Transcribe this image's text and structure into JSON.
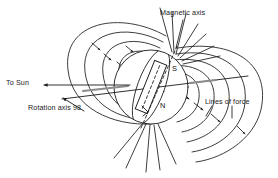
{
  "figure": {
    "title_semantic": "planetary-magnetosphere-diagram",
    "background_color": "#ffffff",
    "stroke_color": "#1a1a1a",
    "accent_gray": "#8c8c8c"
  },
  "labels": {
    "magnetic_axis": "Magnetic axis",
    "to_sun": "To Sun",
    "rotation_axis": "Rotation axis 98",
    "lines_of_force": "Lines of force",
    "pole_south": "S",
    "pole_north": "N"
  },
  "icons": {
    "to_sun_arrow": "arrow-left-icon",
    "rotation_axis_arrow": "arrow-up-right-icon",
    "field_line_arrow": "field-direction-arrow-icon",
    "magnet_bar": "bar-magnet-icon",
    "planet_body": "planet-sphere-icon"
  },
  "geometry": {
    "planet_center": [
      151,
      87
    ],
    "planet_radius": 37,
    "magnetic_axis_tilt_deg": 20,
    "rotation_axis_tilt_deg": 98,
    "magnet_length": 52,
    "magnet_width": 13
  }
}
